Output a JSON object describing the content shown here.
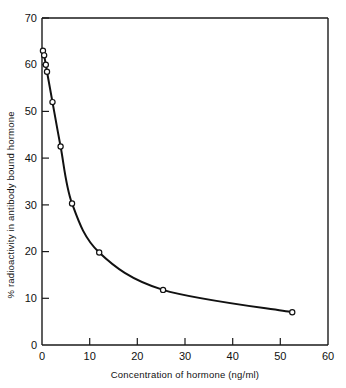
{
  "chart_data": {
    "type": "line",
    "title": "",
    "xlabel": "Concentration of hormone (ng/ml)",
    "ylabel": "% radioactivity in antibody bound hormone",
    "xlim": [
      0,
      60
    ],
    "ylim": [
      0,
      70
    ],
    "xticks": [
      0,
      10,
      20,
      30,
      40,
      50,
      60
    ],
    "xtick_labels": [
      "0",
      "10",
      "20",
      "30",
      "40",
      "50",
      "60"
    ],
    "yticks": [
      0,
      10,
      20,
      30,
      40,
      50,
      60,
      70
    ],
    "ytick_labels": [
      "0",
      "10",
      "20",
      "30",
      "40",
      "50",
      "60",
      "70"
    ],
    "grid": false,
    "legend": false,
    "marker": "open-circle",
    "series": [
      {
        "name": "standard curve",
        "x": [
          0.2,
          0.45,
          0.8,
          1.05,
          2.2,
          3.9,
          6.3,
          12.0,
          25.4,
          52.5
        ],
        "y": [
          63.0,
          62.0,
          60.0,
          58.5,
          52.0,
          42.5,
          30.3,
          19.8,
          11.8,
          7.0
        ]
      }
    ]
  },
  "axes": {
    "x_axis_title": "Concentration of hormone (ng/ml)",
    "y_axis_title": "% radioactivity in antibody bound hormone"
  }
}
